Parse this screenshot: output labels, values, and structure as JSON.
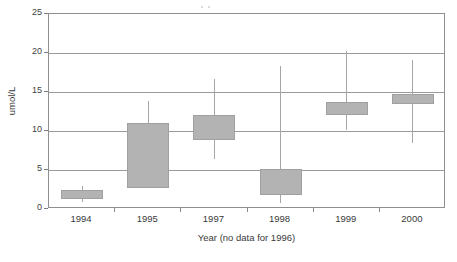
{
  "chart_data": {
    "type": "box",
    "title": "",
    "xlabel": "Year (no data for 1996)",
    "ylabel": "umol/L",
    "categories": [
      "1994",
      "1995",
      "1997",
      "1998",
      "1999",
      "2000"
    ],
    "ylim": [
      0,
      25
    ],
    "yticks": [
      0,
      5,
      10,
      15,
      20,
      25
    ],
    "ytick_labels": [
      "0",
      "5",
      "10",
      "15",
      "20",
      "25"
    ],
    "grid": "horizontal",
    "legend": "none",
    "series": [
      {
        "name": "umol/L distribution",
        "boxes": [
          {
            "category": "1994",
            "whisker_low": 0.9,
            "box_low": 1.3,
            "box_high": 2.4,
            "whisker_high": 2.9
          },
          {
            "category": "1995",
            "whisker_low": 2.7,
            "box_low": 2.7,
            "box_high": 11.0,
            "whisker_high": 13.8
          },
          {
            "category": "1997",
            "whisker_low": 6.4,
            "box_low": 8.8,
            "box_high": 12.0,
            "whisker_high": 16.7
          },
          {
            "category": "1998",
            "whisker_low": 0.8,
            "box_low": 1.8,
            "box_high": 5.1,
            "whisker_high": 18.3
          },
          {
            "category": "1999",
            "whisker_low": 10.1,
            "box_low": 12.1,
            "box_high": 13.7,
            "whisker_high": 20.3
          },
          {
            "category": "2000",
            "whisker_low": 8.5,
            "box_low": 13.5,
            "box_high": 14.7,
            "whisker_high": 19.1
          }
        ]
      }
    ],
    "colors": {
      "box_fill": "#b3b3b3",
      "box_border": "#a0a0a0",
      "whisker": "#a6a6a6",
      "gridline": "#9a9a9a",
      "axis": "#8f8f8f",
      "text": "#3a3a3a",
      "background": "#ffffff"
    }
  }
}
